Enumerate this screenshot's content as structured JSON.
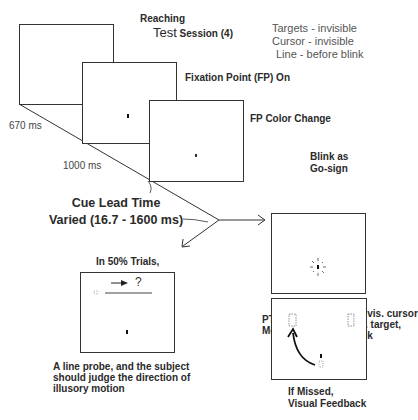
{
  "title": {
    "line1": "Reaching",
    "line2_prefix": "Test",
    "line2_rest": " Session (4)"
  },
  "conditions": [
    "Targets - invisible",
    "Cursor - invisible",
    "Line - before blink"
  ],
  "frames": {
    "fixation_on": "Fixation Point (FP) On",
    "fp_color_change": "FP Color Change"
  },
  "timings": {
    "first_interval": "670 ms",
    "second_interval": "1000 ms"
  },
  "cue_lead": {
    "line1": "Cue Lead Time",
    "line2": "Varied (16.7 - 1600 ms)"
  },
  "go_sign": {
    "line1": "Blink as",
    "line2": "Go-sign"
  },
  "probe_branch": {
    "heading": "In 50% Trials,",
    "question_mark": "?",
    "caption": [
      "A line probe, and the subject",
      "should judge the direction of",
      "illusory motion"
    ]
  },
  "reach_branch": {
    "instruction": [
      "Move invis. cursor",
      "to invis. target,",
      "and click"
    ],
    "pt_label": [
      "PT",
      "Measured"
    ],
    "feedback": [
      "If Missed,",
      "Visual Feedback"
    ]
  }
}
